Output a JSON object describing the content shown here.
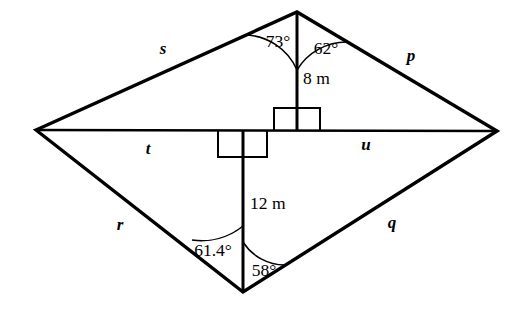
{
  "figure": {
    "background_color": "#ffffff",
    "stroke_color": "#000000"
  },
  "sides": {
    "s": "s",
    "p": "p",
    "r": "r",
    "q": "q"
  },
  "diagonal_segments": {
    "t": "t",
    "u": "u"
  },
  "angles": {
    "top_left": "73°",
    "top_right": "62°",
    "bottom_left": "61.4°",
    "bottom_right": "58°"
  },
  "lengths": {
    "upper_altitude": "8 m",
    "lower_altitude": "12 m"
  },
  "markers": {
    "right_angle_upper": "right-angle",
    "right_angle_lower": "right-angle"
  }
}
